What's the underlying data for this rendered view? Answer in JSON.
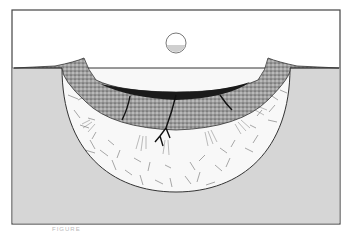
{
  "figure": {
    "type": "impact crater cross-section diagram",
    "caption": "FIGURE",
    "colors": {
      "sky": "#ffffff",
      "ground": "#d6d6d6",
      "fractured_zone": "#f7f7f7",
      "breccia": "#8a8a8a",
      "melt": "#1a1a1a",
      "outline": "#333333",
      "impactor": "#dcdcdc"
    },
    "elements": [
      {
        "name": "impactor",
        "description": "Spherical projectile above the crater"
      },
      {
        "name": "ground-surface",
        "description": "Pre-impact ground level"
      },
      {
        "name": "raised-rim",
        "description": "Uplifted crater rim with ejecta"
      },
      {
        "name": "fractured-bedrock",
        "description": "Shocked, fractured target rock forming the bowl"
      },
      {
        "name": "breccia-lens",
        "description": "Stippled breccia lens filling the crater"
      },
      {
        "name": "melt-layer",
        "description": "Dark impact melt lining the breccia top with veins"
      }
    ]
  }
}
